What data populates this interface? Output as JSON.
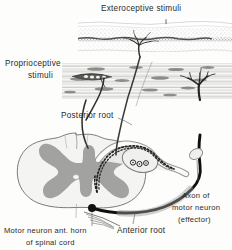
{
  "figure": {
    "background_color": "#fdfdfc",
    "ink_color": "#2a2a28",
    "gray_matter_color": "#9a9a9a",
    "white_matter_color": "#f2f2f0",
    "labels": {
      "exteroceptive": "Exteroceptive stimuli",
      "proprioceptive_line1": "Proprioceptive",
      "proprioceptive_line2": "stimuli",
      "posterior_root": "Posterior root",
      "anterior_root": "Anterior root",
      "motor_neuron_line1": "Motor neuron ant. horn",
      "motor_neuron_line2": "of spinal cord",
      "axon_line1": "Axon of",
      "axon_line2": "motor neuron",
      "axon_line3": "(effector)"
    },
    "structures": {
      "skin": "skin-epidermis-layer",
      "muscle": "striated-muscle-layer",
      "muscle_spindle": "muscle-spindle-receptor",
      "spinal_cord": "spinal-cord-cross-section",
      "gray_matter": "butterfly-gray-matter",
      "central_canal": "central-canal",
      "dorsal_root_ganglion": "dorsal-root-ganglion",
      "ganglion_cell_bodies": 3,
      "sensory_fiber": "afferent-sensory-fiber",
      "motor_fiber": "efferent-motor-axon",
      "motor_neuron_soma": "motor-neuron-cell-body"
    }
  }
}
